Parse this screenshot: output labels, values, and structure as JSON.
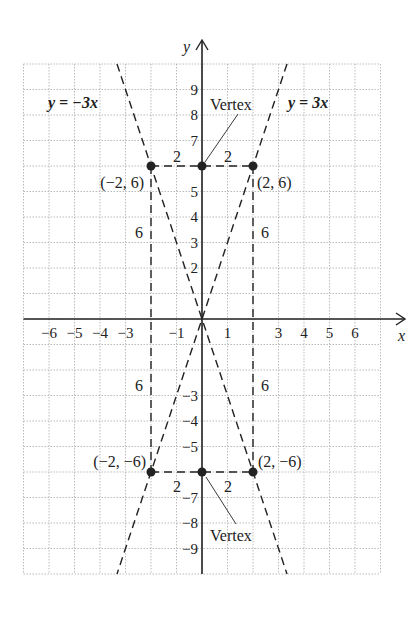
{
  "figure": {
    "type": "coordinate-plane-graph",
    "axes": {
      "x_label": "x",
      "y_label": "y",
      "x_range": [
        -7,
        7
      ],
      "y_range": [
        -10,
        10
      ],
      "x_tick_labels": [
        {
          "value": -6,
          "text": "−6"
        },
        {
          "value": -5,
          "text": "−5"
        },
        {
          "value": -4,
          "text": "−4"
        },
        {
          "value": -3,
          "text": "−3"
        },
        {
          "value": -1,
          "text": "−1"
        },
        {
          "value": 1,
          "text": "1"
        },
        {
          "value": 3,
          "text": "3"
        },
        {
          "value": 4,
          "text": "4"
        },
        {
          "value": 5,
          "text": "5"
        },
        {
          "value": 6,
          "text": "6"
        }
      ],
      "y_tick_labels": [
        {
          "value": 9,
          "text": "9"
        },
        {
          "value": 8,
          "text": "8"
        },
        {
          "value": 7,
          "text": "7"
        },
        {
          "value": 5,
          "text": "5"
        },
        {
          "value": 4,
          "text": "4"
        },
        {
          "value": 3,
          "text": "3"
        },
        {
          "value": 2,
          "text": "2"
        },
        {
          "value": -3,
          "text": "−3"
        },
        {
          "value": -4,
          "text": "−4"
        },
        {
          "value": -5,
          "text": "−5"
        },
        {
          "value": -7,
          "text": "−7"
        },
        {
          "value": -8,
          "text": "−8"
        },
        {
          "value": -9,
          "text": "−9"
        }
      ],
      "grid": "dotted, 1 unit"
    },
    "lines": [
      {
        "label": "y = −3x",
        "slope": -3,
        "style": "dashed"
      },
      {
        "label": "y = 3x",
        "slope": 3,
        "style": "dashed"
      }
    ],
    "points": [
      {
        "x": -2,
        "y": 6,
        "label": "(−2, 6)"
      },
      {
        "x": 0,
        "y": 6,
        "label": ""
      },
      {
        "x": 2,
        "y": 6,
        "label": "(2, 6)"
      },
      {
        "x": -2,
        "y": -6,
        "label": "(−2, −6)"
      },
      {
        "x": 0,
        "y": -6,
        "label": ""
      },
      {
        "x": 2,
        "y": -6,
        "label": "(2, −6)"
      }
    ],
    "annotations": {
      "vertex_top": "Vertex",
      "vertex_bottom": "Vertex",
      "half_width_label": "2",
      "height_label": "6"
    },
    "colors": {
      "ink": "#222222",
      "grid": "#bbbbbb",
      "background": "#ffffff"
    }
  }
}
